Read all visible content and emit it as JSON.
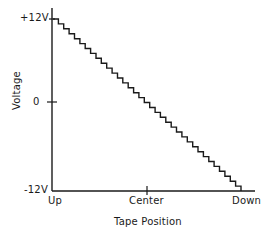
{
  "chart_data": {
    "type": "line",
    "title": "",
    "xlabel": "Tape Position",
    "ylabel": "Voltage",
    "x_tick_labels": [
      "Up",
      "Center",
      "Down"
    ],
    "y_tick_labels": [
      "+12V",
      "0",
      "-12V"
    ],
    "ylim": [
      -12,
      12
    ],
    "xlim": [
      "Up",
      "Down"
    ],
    "grid": false,
    "legend": null,
    "series": [
      {
        "name": "Staircase voltage vs tape position",
        "style": "stepped descending staircase",
        "steps": 35,
        "start": {
          "x": "Up",
          "y": 12
        },
        "end": {
          "x": "Down",
          "y": -12
        },
        "x": [
          0,
          0.5,
          1
        ],
        "values": [
          12,
          0,
          -12
        ]
      }
    ]
  },
  "labels": {
    "y_top": "+12V",
    "y_mid": "0",
    "y_bottom": "-12V",
    "x_left": "Up",
    "x_center": "Center",
    "x_right": "Down",
    "x_axis_title": "Tape Position",
    "y_axis_title": "Voltage"
  },
  "colors": {
    "ink": "#1a1a1a",
    "background": "#ffffff"
  }
}
